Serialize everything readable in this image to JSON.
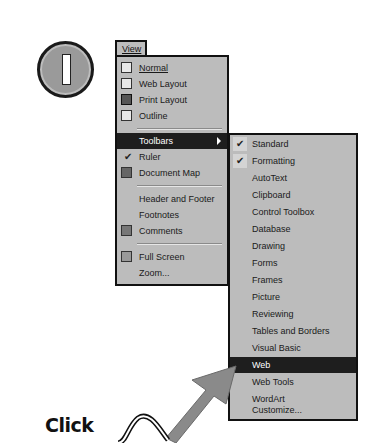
{
  "step": {
    "number": "1"
  },
  "view_menu": {
    "title": "View",
    "items": [
      {
        "label": "Normal",
        "icon": "normal-view-icon"
      },
      {
        "label": "Web Layout",
        "icon": "web-layout-icon"
      },
      {
        "label": "Print Layout",
        "icon": "print-layout-icon"
      },
      {
        "label": "Outline",
        "icon": "outline-icon"
      },
      {
        "label": "Toolbars",
        "highlighted": true,
        "submenu": true
      },
      {
        "label": "Ruler",
        "checked": true
      },
      {
        "label": "Document Map",
        "icon": "document-map-icon"
      },
      {
        "label": "Header and Footer"
      },
      {
        "label": "Footnotes"
      },
      {
        "label": "Comments",
        "icon": "comments-icon"
      },
      {
        "label": "Full Screen",
        "icon": "full-screen-icon"
      },
      {
        "label": "Zoom..."
      }
    ]
  },
  "toolbars_submenu": {
    "items": [
      {
        "label": "Standard",
        "checked": true
      },
      {
        "label": "Formatting",
        "checked": true
      },
      {
        "label": "AutoText"
      },
      {
        "label": "Clipboard"
      },
      {
        "label": "Control Toolbox"
      },
      {
        "label": "Database"
      },
      {
        "label": "Drawing"
      },
      {
        "label": "Forms"
      },
      {
        "label": "Frames"
      },
      {
        "label": "Picture"
      },
      {
        "label": "Reviewing"
      },
      {
        "label": "Tables and Borders"
      },
      {
        "label": "Visual Basic"
      },
      {
        "label": "Web",
        "highlighted": true
      },
      {
        "label": "Web Tools"
      },
      {
        "label": "WordArt"
      },
      {
        "label": "Customize..."
      }
    ]
  },
  "callout": {
    "text": "Click"
  },
  "colors": {
    "menu_bg": "#bcbcbc",
    "highlight": "#1e1e1e",
    "arrow": "#8a8a8a"
  }
}
